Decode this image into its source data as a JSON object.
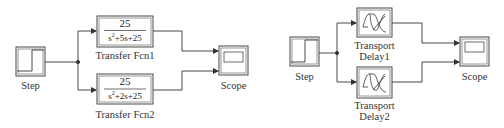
{
  "diagram_left": {
    "step": {
      "label": "Step"
    },
    "tf1": {
      "numerator": "25",
      "denominator_pre": "s",
      "denominator_exp": "2",
      "denominator_post": "+5s+25",
      "label": "Transfer Fcn1"
    },
    "tf2": {
      "numerator": "25",
      "denominator_pre": "s",
      "denominator_exp": "2",
      "denominator_post": "+2s+25",
      "label": "Transfer Fcn2"
    },
    "scope": {
      "label": "Scope"
    }
  },
  "diagram_right": {
    "step": {
      "label": "Step"
    },
    "td1": {
      "label_line1": "Transport",
      "label_line2": "Delay1"
    },
    "td2": {
      "label_line1": "Transport",
      "label_line2": "Delay2"
    },
    "scope": {
      "label": "Scope"
    }
  },
  "colors": {
    "line": "#333333",
    "background": "#ffffff"
  }
}
